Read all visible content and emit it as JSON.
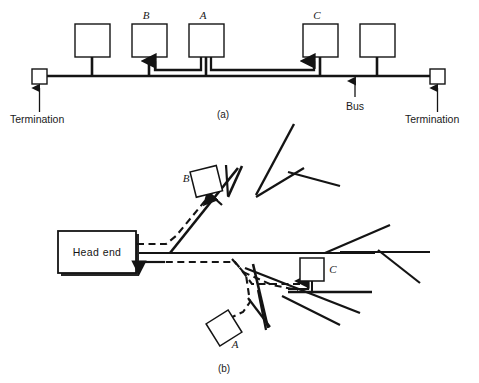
{
  "figure": {
    "caption_a": "(a)",
    "caption_b": "(b)",
    "panel_a": {
      "name": "bus-topology-diagram",
      "labels": {
        "termination_left": "Termination",
        "termination_right": "Termination",
        "bus": "Bus",
        "node_b": "B",
        "node_a": "A",
        "node_c": "C"
      },
      "nodes": [
        {
          "id": "node-1",
          "label": "",
          "x": 75,
          "y": 24,
          "w": 35,
          "h": 33
        },
        {
          "id": "node-b",
          "label": "B",
          "x": 132,
          "y": 24,
          "w": 35,
          "h": 33
        },
        {
          "id": "node-a",
          "label": "A",
          "x": 189,
          "y": 24,
          "w": 35,
          "h": 33
        },
        {
          "id": "node-c",
          "label": "C",
          "x": 303,
          "y": 24,
          "w": 35,
          "h": 33
        },
        {
          "id": "node-5",
          "label": "",
          "x": 360,
          "y": 24,
          "w": 35,
          "h": 33
        }
      ],
      "bus_line": {
        "x1": 42,
        "x2": 438,
        "y": 76
      },
      "terminations": [
        {
          "id": "termination-left",
          "x": 32,
          "y": 69
        },
        {
          "id": "termination-right",
          "x": 430,
          "y": 69
        }
      ]
    },
    "panel_b": {
      "name": "tree-topology-diagram",
      "labels": {
        "head_end": "Head end",
        "node_a": "A",
        "node_b": "B",
        "node_c": "C"
      },
      "head_end_box": {
        "x": 58,
        "y": 231,
        "w": 78,
        "h": 42
      },
      "nodes": [
        {
          "id": "node-b",
          "label": "B",
          "rotated": true
        },
        {
          "id": "node-a",
          "label": "A",
          "rotated": true
        },
        {
          "id": "node-c",
          "label": "C",
          "rotated": false
        }
      ]
    },
    "colors": {
      "ink": "#141414",
      "paper": "#ffffff"
    }
  }
}
